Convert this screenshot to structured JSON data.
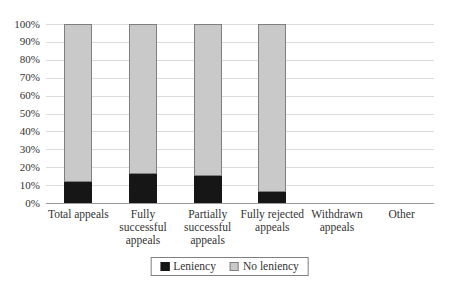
{
  "chart_data": {
    "type": "bar",
    "variant": "100-percent-stacked-column",
    "title": "",
    "xlabel": "",
    "ylabel": "",
    "categories": [
      "Total appeals",
      "Fully successful appeals",
      "Partially successful appeals",
      "Fully rejected appeals",
      "Withdrawn appeals",
      "Other"
    ],
    "category_display_labels": [
      "Total appeals",
      "Fully\nsuccessful\nappeals",
      "Partially\nsuccessful\nappeals",
      "Fully rejected\nappeals",
      "Withdrawn\nappeals",
      "Other"
    ],
    "series": [
      {
        "name": "Leniency",
        "color": "#161616",
        "values": [
          12,
          16,
          15,
          6,
          0,
          0
        ]
      },
      {
        "name": "No leniency",
        "color": "#c9c9c9",
        "values": [
          88,
          84,
          85,
          94,
          0,
          0
        ]
      }
    ],
    "ylim": [
      0,
      100
    ],
    "ytick_step": 10,
    "ytick_labels": [
      "0%",
      "10%",
      "20%",
      "30%",
      "40%",
      "50%",
      "60%",
      "70%",
      "80%",
      "90%",
      "100%"
    ],
    "grid": true,
    "legend_position": "bottom-center"
  },
  "style": {
    "background": "#ffffff",
    "gridline_color": "#dcdcdc",
    "axis_color": "#9b9b9b",
    "bar_border_color": "#7f7f7f",
    "text_color": "#333333"
  }
}
